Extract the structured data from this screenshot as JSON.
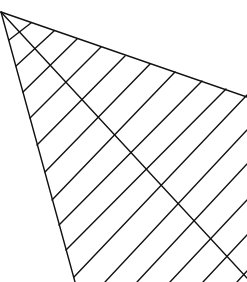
{
  "diagram": {
    "width": 247,
    "height": 282,
    "background": "#ffffff",
    "stroke_color": "#111111",
    "stroke_width": 1.4,
    "outline": {
      "top_edge": {
        "x1": 1,
        "y1": 12,
        "x2": 247,
        "y2": 97
      },
      "left_edge": {
        "x1": 1,
        "y1": 12,
        "x2": 75,
        "y2": 282
      }
    },
    "diagonal": {
      "x1": 1,
      "y1": 12,
      "x2": 247,
      "y2": 278
    },
    "hatch_lines": [
      {
        "x1": 9,
        "y1": 40,
        "x2": 31,
        "y2": 23
      },
      {
        "x1": 16,
        "y1": 66,
        "x2": 54,
        "y2": 31
      },
      {
        "x1": 23,
        "y1": 92,
        "x2": 77,
        "y2": 39
      },
      {
        "x1": 30,
        "y1": 118,
        "x2": 101,
        "y2": 47
      },
      {
        "x1": 37,
        "y1": 145,
        "x2": 125,
        "y2": 56
      },
      {
        "x1": 45,
        "y1": 172,
        "x2": 150,
        "y2": 64
      },
      {
        "x1": 52,
        "y1": 200,
        "x2": 175,
        "y2": 72
      },
      {
        "x1": 59,
        "y1": 225,
        "x2": 202,
        "y2": 81
      },
      {
        "x1": 66,
        "y1": 250,
        "x2": 226,
        "y2": 89
      },
      {
        "x1": 74,
        "y1": 277,
        "x2": 247,
        "y2": 95
      },
      {
        "x1": 105,
        "y1": 282,
        "x2": 247,
        "y2": 130
      },
      {
        "x1": 137,
        "y1": 282,
        "x2": 247,
        "y2": 164
      },
      {
        "x1": 170,
        "y1": 282,
        "x2": 247,
        "y2": 200
      },
      {
        "x1": 203,
        "y1": 282,
        "x2": 247,
        "y2": 235
      },
      {
        "x1": 237,
        "y1": 282,
        "x2": 247,
        "y2": 271
      }
    ]
  }
}
